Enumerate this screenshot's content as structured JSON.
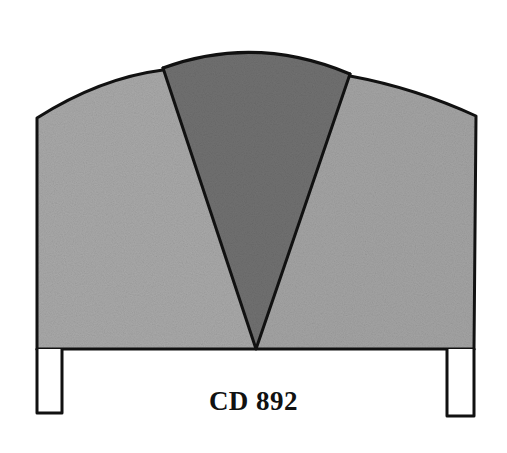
{
  "product": {
    "code": "CD 892",
    "type": "headboard-illustration"
  },
  "colors": {
    "side_panel_fill": "#a7a7a7",
    "center_wedge_fill": "#6f6f6f",
    "outline": "#111111",
    "background": "#ffffff",
    "legs_fill": "#ffffff"
  }
}
